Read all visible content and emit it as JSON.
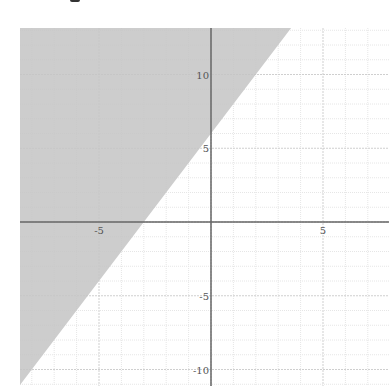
{
  "chart_data": {
    "type": "area",
    "title": "",
    "inequality": "y >= 2x + 6",
    "boundary_line": {
      "slope": 2,
      "intercept": 6,
      "style": "solid"
    },
    "shaded_side": "above",
    "xlabel": "",
    "ylabel": "",
    "xlim": [
      -8.5,
      7.9
    ],
    "ylim": [
      -11,
      13
    ],
    "x_ticks": [
      -5,
      5
    ],
    "y_ticks": [
      10,
      5,
      -5,
      -10
    ],
    "x_tick_labels": [
      "-5",
      "5"
    ],
    "y_tick_labels": [
      "10",
      "5",
      "-5",
      "-10"
    ],
    "grid": true,
    "legend": null
  },
  "colors": {
    "shade": "#c4c4c4",
    "axis": "#666666",
    "grid_major": "#cfcfcf",
    "grid_minor": "#e6e6e6",
    "background": "#ffffff"
  }
}
